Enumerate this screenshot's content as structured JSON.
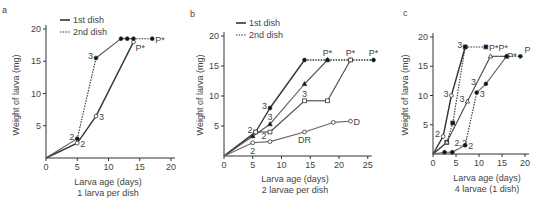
{
  "chart_data": [
    {
      "panel": "a",
      "type": "line",
      "title": "",
      "xlabel": "Larva age (days)",
      "subtitle": "1 larva per dish",
      "ylabel": "Weight of larva (mg)",
      "xlim": [
        0,
        20
      ],
      "ylim": [
        0,
        20
      ],
      "xticks": [
        0,
        5,
        10,
        15,
        20
      ],
      "yticks": [
        5,
        10,
        15,
        20
      ],
      "legend": [
        {
          "label": "1st dish",
          "style": "solid"
        },
        {
          "label": "2nd dish",
          "style": "dotted"
        }
      ],
      "series": [
        {
          "name": "Larva 1 (open)",
          "marker": "open-circle",
          "points": [
            [
              0,
              0,
              "solid"
            ],
            [
              5,
              2.3,
              "solid"
            ],
            [
              8,
              6.5,
              "solid"
            ],
            [
              14,
              18,
              "solid"
            ]
          ],
          "labels": [
            {
              "x": 5,
              "y": 2.3,
              "text": "2",
              "pos": "right"
            },
            {
              "x": 8,
              "y": 6.5,
              "text": "3",
              "pos": "right"
            },
            {
              "x": 14,
              "y": 18,
              "text": "P*",
              "pos": "below-right"
            }
          ]
        },
        {
          "name": "Larva 2 (filled)",
          "marker": "filled-circle",
          "points": [
            [
              0,
              0,
              "solid"
            ],
            [
              5,
              3,
              "solid"
            ],
            [
              8,
              15.5,
              "dotted"
            ],
            [
              12,
              18.5,
              "solid"
            ],
            [
              13,
              18.5,
              "solid"
            ],
            [
              14,
              18.5,
              "solid"
            ],
            [
              17,
              18.5,
              "dotted"
            ]
          ],
          "labels": [
            {
              "x": 5,
              "y": 3,
              "text": "2",
              "pos": "left"
            },
            {
              "x": 8,
              "y": 15.5,
              "text": "3",
              "pos": "left"
            },
            {
              "x": 17,
              "y": 18.5,
              "text": "P*",
              "pos": "right"
            }
          ]
        }
      ]
    },
    {
      "panel": "b",
      "type": "line",
      "title": "",
      "xlabel": "Larva age (days)",
      "subtitle": "2 larvae per dish",
      "ylabel": "Weight of larva (mg)",
      "xlim": [
        0,
        25
      ],
      "ylim": [
        0,
        20
      ],
      "xticks": [
        0,
        5,
        10,
        15,
        20,
        25
      ],
      "yticks": [
        5,
        10,
        15,
        20
      ],
      "legend": [
        {
          "label": "1st dish",
          "style": "solid"
        },
        {
          "label": "2nd dish",
          "style": "dotted"
        }
      ],
      "series": [
        {
          "name": "Filled circle",
          "marker": "filled-circle",
          "points": [
            [
              0,
              0,
              "solid"
            ],
            [
              5.5,
              4,
              "solid"
            ],
            [
              8,
              8,
              "solid"
            ],
            [
              14,
              16,
              "solid"
            ],
            [
              18,
              16,
              "dotted"
            ],
            [
              22,
              16,
              "dotted"
            ],
            [
              26,
              16,
              "dotted"
            ]
          ],
          "labels": [
            {
              "x": 5.5,
              "y": 4,
              "text": "2",
              "pos": "left"
            },
            {
              "x": 8,
              "y": 8,
              "text": "3",
              "pos": "left"
            },
            {
              "x": 26,
              "y": 16,
              "text": "P*",
              "pos": "above"
            }
          ]
        },
        {
          "name": "Filled triangle",
          "marker": "filled-triangle",
          "points": [
            [
              0,
              0,
              "solid"
            ],
            [
              5,
              3.3,
              "solid"
            ],
            [
              8,
              5.3,
              "solid"
            ],
            [
              14,
              12,
              "solid"
            ],
            [
              18,
              16,
              "solid"
            ]
          ],
          "labels": [
            {
              "x": 8,
              "y": 5.3,
              "text": "3",
              "pos": "above"
            },
            {
              "x": 18,
              "y": 16,
              "text": "P*",
              "pos": "above"
            }
          ]
        },
        {
          "name": "Open square",
          "marker": "open-square",
          "points": [
            [
              0,
              0,
              "solid"
            ],
            [
              5.5,
              4,
              "solid"
            ],
            [
              8,
              4,
              "solid"
            ],
            [
              14,
              9.2,
              "solid"
            ],
            [
              18,
              9.2,
              "solid"
            ],
            [
              22,
              16,
              "solid"
            ]
          ],
          "labels": [
            {
              "x": 6,
              "y": 3.5,
              "text": "2",
              "pos": "right"
            },
            {
              "x": 14,
              "y": 9.2,
              "text": "3",
              "pos": "above"
            },
            {
              "x": 22,
              "y": 16,
              "text": "P*",
              "pos": "above"
            }
          ]
        },
        {
          "name": "Open circle",
          "marker": "open-circle",
          "points": [
            [
              0,
              0,
              "solid"
            ],
            [
              5,
              2.2,
              "solid"
            ],
            [
              8,
              2.4,
              "solid"
            ],
            [
              14,
              4,
              "solid"
            ],
            [
              19,
              5.6,
              "solid"
            ],
            [
              22,
              5.8,
              "solid"
            ]
          ],
          "labels": [
            {
              "x": 5,
              "y": 2.2,
              "text": "2",
              "pos": "below"
            },
            {
              "x": 14,
              "y": 4,
              "text": "DR",
              "pos": "below"
            },
            {
              "x": 22,
              "y": 5.8,
              "text": "D",
              "pos": "right"
            }
          ]
        }
      ]
    },
    {
      "panel": "c",
      "type": "line",
      "title": "",
      "xlabel": "Larva age (days)",
      "subtitle": "4 larvae (1 dish)",
      "ylabel": "Weight of larva (mg)",
      "xlim": [
        0,
        20
      ],
      "ylim": [
        0,
        20
      ],
      "xticks": [
        0,
        5,
        10,
        15,
        20
      ],
      "yticks": [
        5,
        10,
        15,
        20
      ],
      "series": [
        {
          "name": "Open circle (fast)",
          "marker": "open-circle",
          "points": [
            [
              0,
              0,
              "solid"
            ],
            [
              2.2,
              3,
              "solid"
            ],
            [
              4,
              10,
              "solid"
            ],
            [
              7,
              18.3,
              "solid"
            ]
          ],
          "labels": [
            {
              "x": 2.2,
              "y": 3,
              "text": "2",
              "pos": "left"
            },
            {
              "x": 4,
              "y": 10,
              "text": "3",
              "pos": "left"
            },
            {
              "x": 7,
              "y": 18.3,
              "text": "3",
              "pos": "left"
            }
          ]
        },
        {
          "name": "Filled square",
          "marker": "filled-square",
          "points": [
            [
              0,
              0,
              "solid"
            ],
            [
              3,
              2,
              "solid"
            ],
            [
              4.3,
              5.3,
              "dotted"
            ],
            [
              7,
              18.3,
              "dotted"
            ],
            [
              11.5,
              18.3,
              "dotted"
            ]
          ],
          "labels": [
            {
              "x": 4,
              "y": 2,
              "text": "2,2",
              "pos": "right"
            },
            {
              "x": 11.5,
              "y": 18.3,
              "text": "P*P*",
              "pos": "right"
            }
          ]
        },
        {
          "name": "Open triangle",
          "marker": "open-triangle",
          "points": [
            [
              0,
              0,
              "solid"
            ],
            [
              3,
              2,
              "solid"
            ],
            [
              7.5,
              9,
              "solid"
            ],
            [
              12.5,
              16.7,
              "solid"
            ],
            [
              16,
              16.7,
              "solid"
            ]
          ],
          "labels": [
            {
              "x": 7.5,
              "y": 9,
              "text": "3",
              "pos": "left"
            },
            {
              "x": 10,
              "y": 12,
              "text": "3",
              "pos": "left"
            },
            {
              "x": 15.5,
              "y": 17,
              "text": "P*",
              "pos": "right"
            }
          ]
        },
        {
          "name": "Filled circle (slow)",
          "marker": "filled-circle",
          "points": [
            [
              0,
              0,
              "solid"
            ],
            [
              2.5,
              0.3,
              "solid"
            ],
            [
              4.2,
              0.3,
              "solid"
            ],
            [
              7,
              1.5,
              "solid"
            ],
            [
              9.5,
              10.5,
              "dotted"
            ],
            [
              11.5,
              12,
              "solid"
            ],
            [
              16,
              16.7,
              "solid"
            ],
            [
              19,
              16.7,
              "dotted"
            ]
          ],
          "labels": [
            {
              "x": 7,
              "y": 1.5,
              "text": "2",
              "pos": "right"
            },
            {
              "x": 9.5,
              "y": 10.5,
              "text": "3",
              "pos": "right"
            },
            {
              "x": 19,
              "y": 16.7,
              "text": "P",
              "pos": "above-right"
            }
          ]
        }
      ]
    }
  ],
  "panels": [
    {
      "letter": "a",
      "xlabel": "Larva age (days)",
      "subtitle": "1 larva per dish",
      "ylabel": "Weight of larva (mg)",
      "legend": [
        "1st dish",
        "2nd dish"
      ]
    },
    {
      "letter": "b",
      "xlabel": "Larva age (days)",
      "subtitle": "2 larvae per dish",
      "ylabel": "Weight of larva (mg)",
      "legend": [
        "1st dish",
        "2nd dish"
      ]
    },
    {
      "letter": "c",
      "xlabel": "Larva age (days)",
      "subtitle": "4 larvae (1 dish)",
      "ylabel": "Weight of larva (mg)"
    }
  ],
  "colors": {
    "axis": "#333333",
    "line_dark": "#333333",
    "line_light": "#777777",
    "text": "#444444"
  }
}
